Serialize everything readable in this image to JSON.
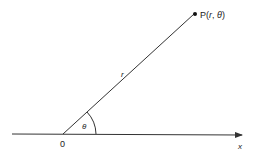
{
  "diagram": {
    "point_label": "P(",
    "point_r": "r",
    "point_sep": ", ",
    "point_theta": "θ",
    "point_close": ")",
    "radius_label": "r",
    "angle_label": "θ",
    "origin_label": "0",
    "axis_label": "x"
  },
  "colors": {
    "line": "#333333",
    "background": "#ffffff"
  }
}
